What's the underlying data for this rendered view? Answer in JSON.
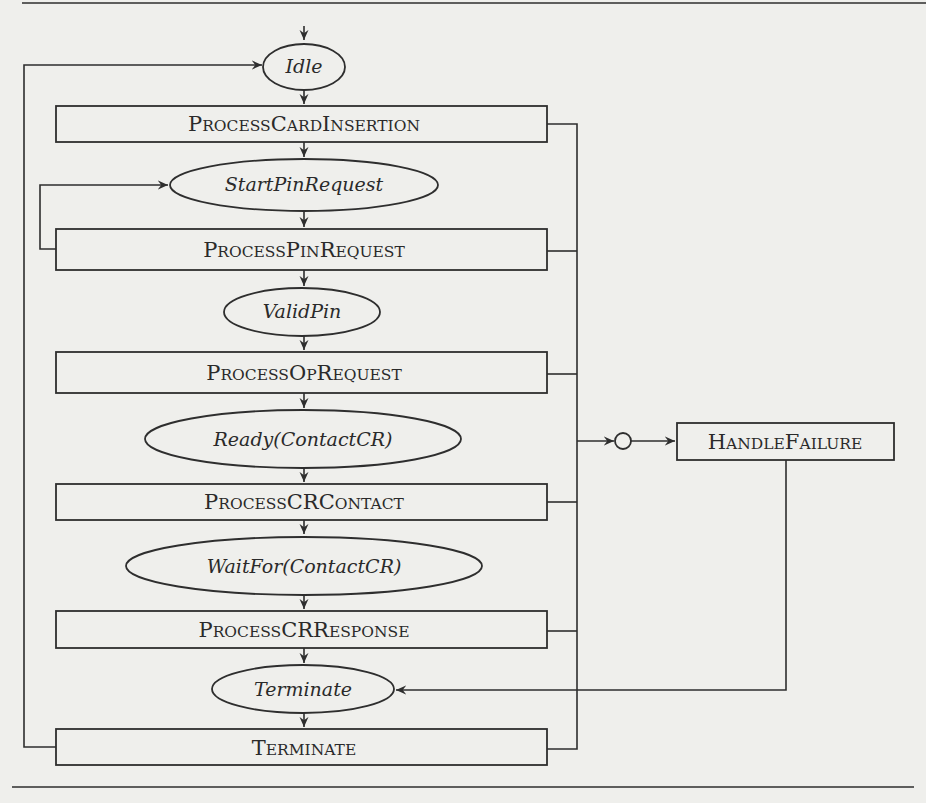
{
  "diagram": {
    "type": "state-flow",
    "states": [
      {
        "id": "idle",
        "label": "Idle"
      },
      {
        "id": "start-pin-request",
        "label": "StartPinRequest"
      },
      {
        "id": "valid-pin",
        "label": "ValidPin"
      },
      {
        "id": "ready-contact-cr",
        "label": "Ready(ContactCR)"
      },
      {
        "id": "waitfor-contact-cr",
        "label": "WaitFor(ContactCR)"
      },
      {
        "id": "terminate-state",
        "label": "Terminate"
      }
    ],
    "processes": [
      {
        "id": "process-card-insertion",
        "big": [
          "P",
          "C",
          "I"
        ],
        "small": [
          "ROCESS",
          "ARD",
          "NSERTION"
        ]
      },
      {
        "id": "process-pin-request",
        "big": [
          "P",
          "P",
          "R"
        ],
        "small": [
          "ROCESS",
          "IN",
          "EQUEST"
        ]
      },
      {
        "id": "process-op-request",
        "big": [
          "P",
          "O",
          "R"
        ],
        "small": [
          "ROCESS",
          "P",
          "EQUEST"
        ]
      },
      {
        "id": "process-cr-contact",
        "big": [
          "P",
          "CRC"
        ],
        "small": [
          "ROCESS",
          "ONTACT"
        ]
      },
      {
        "id": "process-cr-response",
        "big": [
          "P",
          "CRR"
        ],
        "small": [
          "ROCESS",
          "ESPONSE"
        ]
      },
      {
        "id": "terminate-process",
        "big": [
          "T"
        ],
        "small": [
          "ERMINATE"
        ]
      }
    ],
    "handler": {
      "id": "handle-failure",
      "big": [
        "H",
        "F"
      ],
      "small": [
        "ANDLE",
        "AILURE"
      ]
    },
    "labels": {
      "process_card_insertion": "ProcessCardInsertion",
      "process_pin_request": "ProcessPinRequest",
      "process_op_request": "ProcessOpRequest",
      "process_cr_contact": "ProcessCRContact",
      "process_cr_response": "ProcessCRResponse",
      "terminate_process": "Terminate",
      "handle_failure": "HandleFailure"
    },
    "colors": {
      "ink": "#2e2e2e",
      "paper": "#efefec"
    }
  }
}
